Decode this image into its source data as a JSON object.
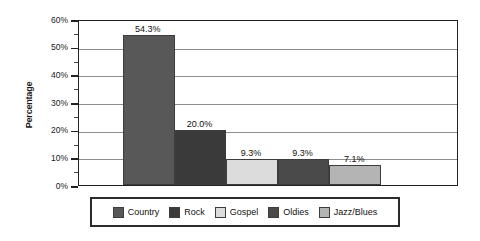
{
  "chart_data": {
    "type": "bar",
    "title": "",
    "xlabel": "",
    "ylabel": "Percentage",
    "categories": [
      "Country",
      "Rock",
      "Gospel",
      "Oldies",
      "Jazz/Blues"
    ],
    "values": [
      54.3,
      20.0,
      9.3,
      9.3,
      7.1
    ],
    "value_labels": [
      "54.3%",
      "20.0%",
      "9.3%",
      "9.3%",
      "7.1%"
    ],
    "colors": [
      "#585858",
      "#3a3a3a",
      "#dcdcdc",
      "#4a4a4a",
      "#b4b4b4"
    ],
    "ylim": [
      0,
      60
    ],
    "ytick_labels": [
      "60%",
      "50%",
      "40%",
      "30%",
      "20%",
      "10%",
      "0%"
    ],
    "ytick_values": [
      60,
      50,
      40,
      30,
      20,
      10,
      0
    ],
    "yminor_values": [
      55,
      45,
      35,
      25,
      15,
      5
    ],
    "grid": "horizontal",
    "legend_position": "bottom"
  },
  "legend": {
    "items": [
      {
        "label": "Country",
        "color": "#585858"
      },
      {
        "label": "Rock",
        "color": "#3a3a3a"
      },
      {
        "label": "Gospel",
        "color": "#dcdcdc"
      },
      {
        "label": "Oldies",
        "color": "#4a4a4a"
      },
      {
        "label": "Jazz/Blues",
        "color": "#b4b4b4"
      }
    ]
  }
}
